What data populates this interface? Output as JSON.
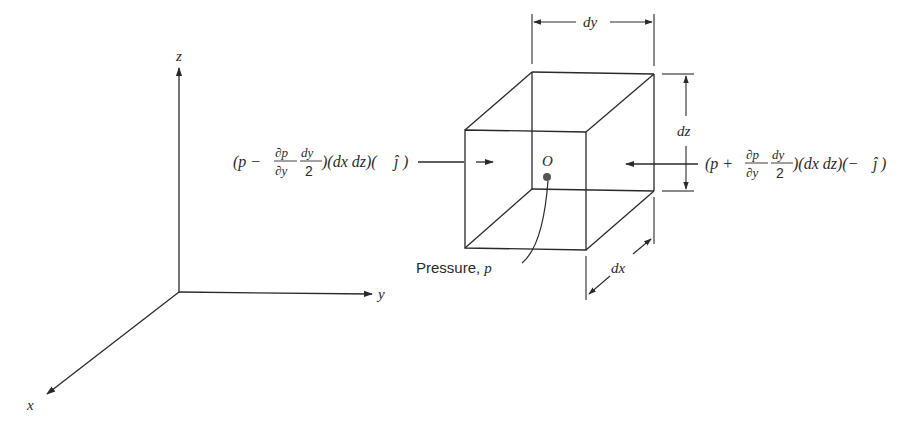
{
  "figure": {
    "type": "diagram",
    "colors": {
      "ink": "#2a2a2a",
      "point": "#555555",
      "background": "#ffffff"
    }
  },
  "axes": {
    "x_label": "x",
    "y_label": "y",
    "z_label": "z"
  },
  "element": {
    "center_label": "O",
    "dimension_dy": "dy",
    "dimension_dz": "dz",
    "dimension_dx": "dx",
    "pressure_label": "Pressure, ",
    "pressure_symbol": "p"
  },
  "forces": {
    "left": {
      "open": "(p − ",
      "dp": "∂p",
      "dy_den": "∂y",
      "frac_num": "dy",
      "frac_den": "2",
      "tail": ")(dx dz)(",
      "unit": "ĵ",
      "close": " )"
    },
    "right": {
      "open": "(p + ",
      "dp": "∂p",
      "dy_den": "∂y",
      "frac_num": "dy",
      "frac_den": "2",
      "tail": ")(dx dz)(−",
      "unit": "ĵ",
      "close": ")"
    }
  }
}
